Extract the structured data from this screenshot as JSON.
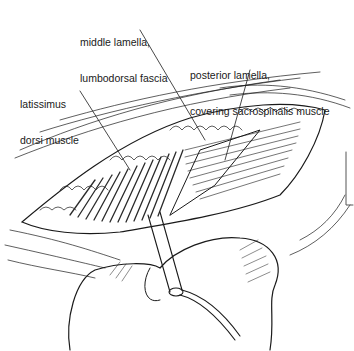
{
  "figure": {
    "type": "surgical line illustration",
    "labels": [
      {
        "id": "middle-lamella",
        "line1": "middle lamella,",
        "line2": "lumbodorsal fascia"
      },
      {
        "id": "posterior-lamella",
        "line1": "posterior lamella,",
        "line2": "covering sacrospinalis muscle"
      },
      {
        "id": "latissimus",
        "line1": "latissimus",
        "line2": "dorsi muscle"
      }
    ],
    "colors": {
      "ink": "#1a1a1a",
      "background": "#ffffff",
      "shade": "#3a3a3a"
    }
  }
}
